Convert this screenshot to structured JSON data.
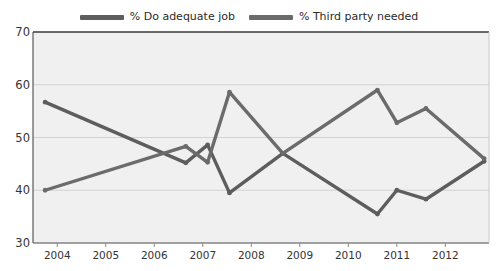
{
  "legend": {
    "position": "top-center",
    "entries": [
      {
        "label": "% Do adequate job",
        "color": "#5d5d5d",
        "swatch_name": "legend-swatch-adequate-job"
      },
      {
        "label": "% Third party needed",
        "color": "#6b6b6b",
        "swatch_name": "legend-swatch-third-party"
      }
    ]
  },
  "chart_data": {
    "type": "line",
    "title": "",
    "subtitle": "",
    "xlabel": "",
    "ylabel": "",
    "xlim": [
      2003.5,
      2012.9
    ],
    "ylim": [
      30,
      70
    ],
    "yticks": [
      30,
      40,
      50,
      60,
      70
    ],
    "ytick_labels": [
      "30",
      "40",
      "50",
      "60",
      "70"
    ],
    "xticks": [
      2004,
      2005,
      2006,
      2007,
      2008,
      2009,
      2010,
      2011,
      2012
    ],
    "xtick_labels": [
      "2004",
      "2005",
      "2006",
      "2007",
      "2008",
      "2009",
      "2010",
      "2011",
      "2012"
    ],
    "grid": "horizontal",
    "plot_background": "#f0f0f0",
    "series": [
      {
        "name": "% Do adequate job",
        "color": "#5d5d5d",
        "marker": "circle",
        "x": [
          2003.75,
          2006.65,
          2007.1,
          2007.55,
          2008.65,
          2010.6,
          2011.0,
          2011.6,
          2012.8
        ],
        "values": [
          56.7,
          45.2,
          48.6,
          39.5,
          47.0,
          35.5,
          40.0,
          38.3,
          45.5
        ]
      },
      {
        "name": "% Third party needed",
        "color": "#6b6b6b",
        "marker": "circle",
        "x": [
          2003.75,
          2006.65,
          2007.1,
          2007.55,
          2008.65,
          2010.6,
          2011.0,
          2011.6,
          2012.8
        ],
        "values": [
          40.0,
          48.3,
          45.3,
          58.6,
          47.0,
          59.0,
          52.8,
          55.5,
          46.0
        ]
      }
    ],
    "annotations": []
  }
}
